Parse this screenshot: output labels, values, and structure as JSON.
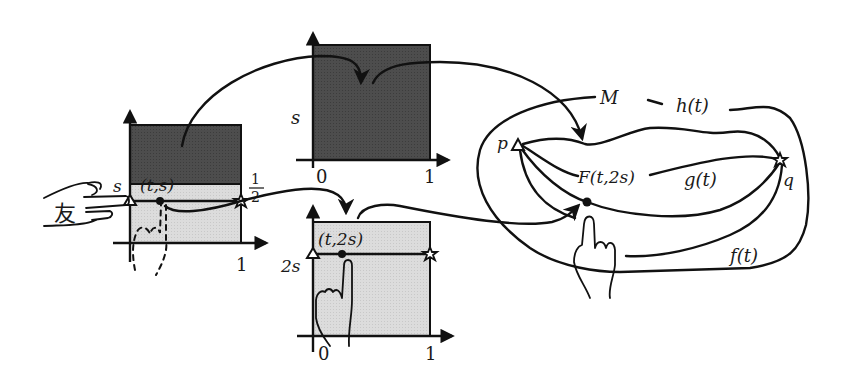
{
  "diagram": {
    "colors": {
      "dark_fill": "#4a4a4a",
      "light_fill": "#d9d9d9",
      "line": "#111111",
      "background": "#ffffff"
    },
    "left_plot": {
      "y_label": "s",
      "point_label": "(t,s)",
      "half_label_num": "1",
      "half_label_den": "2",
      "x_tick_1": "1",
      "hand_char": "友",
      "markers": [
        "triangle",
        "dot",
        "star"
      ]
    },
    "top_plot": {
      "y_label": "s",
      "x_tick_0": "0",
      "x_tick_1": "1"
    },
    "bottom_plot": {
      "y_label": "2s",
      "point_label": "(t,2s)",
      "x_tick_0": "0",
      "x_tick_1": "1",
      "markers": [
        "triangle",
        "dot",
        "star"
      ]
    },
    "manifold": {
      "space_label": "M",
      "start_point": "p",
      "end_point": "q",
      "curve_h": "h(t)",
      "curve_g": "g(t)",
      "curve_f": "f(t)",
      "homotopy_label": "F(t,2s)"
    }
  }
}
